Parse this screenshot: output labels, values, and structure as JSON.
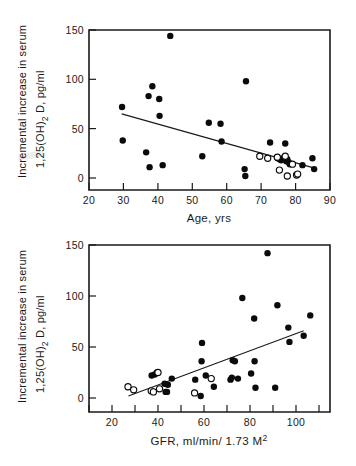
{
  "figure": {
    "title": "",
    "background": "#ffffff",
    "marker_filled_color": "#0b0b0b",
    "marker_open_color": "#ffffff",
    "axis_color": "#1a1a1a"
  },
  "panels": {
    "top": {
      "name": "age-scatter-panel",
      "ylabel_line1": "Incremental increase in serum",
      "ylabel_line2_pre": "1,25(OH)",
      "ylabel_line2_sub": "2",
      "ylabel_line2_post": " D, pg/ml",
      "xlabel": "Age, yrs",
      "x_ticks": [
        "20",
        "30",
        "40",
        "50",
        "60",
        "70",
        "80",
        "90"
      ],
      "y_ticks": [
        "0",
        "50",
        "100",
        "150"
      ]
    },
    "bottom": {
      "name": "gfr-scatter-panel",
      "ylabel_line1": "Incremental increase in serum",
      "ylabel_line2_pre": "1,25(OH)",
      "ylabel_line2_sub": "2",
      "ylabel_line2_post": " D, pg/ml",
      "xlabel_pre": "GFR, ml/min/ 1.73 M",
      "xlabel_sup": "2",
      "x_ticks": [
        "20",
        "40",
        "60",
        "80",
        "100"
      ],
      "y_ticks": [
        "0",
        "50",
        "100",
        "150"
      ]
    }
  },
  "chart_data": [
    {
      "type": "scatter",
      "id": "age-vs-incremental-1-25-oh2-d",
      "title": "",
      "xlabel": "Age, yrs",
      "ylabel": "Incremental increase in serum 1,25(OH)2 D, pg/ml",
      "xlim": [
        20,
        90
      ],
      "ylim": [
        0,
        150
      ],
      "xticks": [
        20,
        30,
        40,
        50,
        60,
        70,
        80,
        90
      ],
      "yticks": [
        0,
        50,
        100,
        150
      ],
      "grid": false,
      "legend": "none",
      "series": [
        {
          "name": "filled-circles",
          "marker": "filled circle",
          "points": [
            [
              29.6,
              72
            ],
            [
              29.8,
              38
            ],
            [
              36.6,
              26
            ],
            [
              37.3,
              83
            ],
            [
              37.6,
              11
            ],
            [
              38.4,
              93
            ],
            [
              40.4,
              80
            ],
            [
              40.5,
              63
            ],
            [
              41.4,
              13
            ],
            [
              43.6,
              144
            ],
            [
              52.9,
              22
            ],
            [
              54.8,
              56
            ],
            [
              58.2,
              55
            ],
            [
              58.5,
              37
            ],
            [
              65.2,
              9
            ],
            [
              65.4,
              2
            ],
            [
              65.6,
              98
            ],
            [
              72.6,
              36
            ],
            [
              74.8,
              20
            ],
            [
              75.4,
              19
            ],
            [
              75.8,
              18
            ],
            [
              76.4,
              20
            ],
            [
              77.0,
              35
            ],
            [
              77.3,
              17
            ],
            [
              77.6,
              19
            ],
            [
              78.0,
              16
            ],
            [
              78.3,
              14
            ],
            [
              82.0,
              13
            ],
            [
              84.9,
              20
            ],
            [
              85.4,
              9
            ]
          ]
        },
        {
          "name": "open-circles",
          "marker": "open circle",
          "points": [
            [
              69.6,
              22
            ],
            [
              71.9,
              20
            ],
            [
              74.7,
              21
            ],
            [
              75.3,
              8
            ],
            [
              77.0,
              22
            ],
            [
              77.6,
              2
            ],
            [
              79.1,
              14
            ],
            [
              80.3,
              3
            ],
            [
              80.6,
              4
            ]
          ]
        }
      ],
      "regression_line": {
        "x_start": 29.5,
        "y_start": 65,
        "x_end": 85.5,
        "y_end": 10,
        "relationship": "negative"
      }
    },
    {
      "type": "scatter",
      "id": "gfr-vs-incremental-1-25-oh2-d",
      "title": "",
      "xlabel": "GFR, ml/min/ 1.73 M2",
      "ylabel": "Incremental increase in serum 1,25(OH)2 D, pg/ml",
      "xlim": [
        10,
        115
      ],
      "ylim": [
        0,
        150
      ],
      "xticks": [
        20,
        40,
        60,
        80,
        100
      ],
      "yticks": [
        0,
        50,
        100,
        150
      ],
      "grid": false,
      "legend": "none",
      "series": [
        {
          "name": "filled-circles",
          "marker": "filled circle",
          "points": [
            [
              38.6,
              22
            ],
            [
              40.0,
              23
            ],
            [
              41.0,
              25
            ],
            [
              44.5,
              14
            ],
            [
              45.0,
              6
            ],
            [
              45.6,
              6
            ],
            [
              46.0,
              13
            ],
            [
              47.8,
              19
            ],
            [
              58.5,
              18
            ],
            [
              61.0,
              2
            ],
            [
              61.4,
              36
            ],
            [
              61.6,
              54
            ],
            [
              63.3,
              22
            ],
            [
              67.0,
              11
            ],
            [
              74.6,
              18
            ],
            [
              75.2,
              20
            ],
            [
              75.6,
              37
            ],
            [
              76.6,
              36
            ],
            [
              78.0,
              19
            ],
            [
              80.0,
              98
            ],
            [
              84.0,
              24
            ],
            [
              85.4,
              78
            ],
            [
              85.6,
              36
            ],
            [
              86.0,
              10
            ],
            [
              91.5,
              142
            ],
            [
              95.0,
              10
            ],
            [
              96.0,
              91
            ],
            [
              101.0,
              69
            ],
            [
              101.5,
              55
            ],
            [
              108.0,
              61
            ],
            [
              111.0,
              81
            ]
          ]
        },
        {
          "name": "open-circles",
          "marker": "open circle",
          "points": [
            [
              27.8,
              11
            ],
            [
              30.4,
              8
            ],
            [
              38.4,
              7
            ],
            [
              39.4,
              6
            ],
            [
              41.5,
              25
            ],
            [
              42.2,
              9
            ],
            [
              58.2,
              5
            ],
            [
              65.8,
              19
            ]
          ]
        }
      ],
      "regression_line": {
        "x_start": 28,
        "y_start": 2,
        "x_end": 108,
        "y_end": 66,
        "relationship": "positive"
      }
    }
  ]
}
